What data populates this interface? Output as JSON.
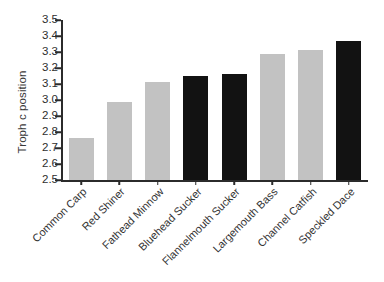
{
  "chart_data": {
    "type": "bar",
    "title": "",
    "xlabel": "",
    "ylabel": "Troph c position",
    "ylim": [
      2.5,
      3.5
    ],
    "ytick_labels": [
      "3.5",
      "3.4",
      "3.3",
      "3.2",
      "3.1",
      "3.0",
      "2.9",
      "2.8",
      "2.7",
      "2.6",
      "2.5"
    ],
    "ytick_values": [
      3.5,
      3.4,
      3.3,
      3.2,
      3.1,
      3.0,
      2.9,
      2.8,
      2.7,
      2.6,
      2.5
    ],
    "grid": false,
    "legend": "none",
    "categories": [
      "Common Carp",
      "Red Shiner",
      "Fathead Minnow",
      "Bluehead Sucker",
      "Flannelmouth Sucker",
      "Largemouth Bass",
      "Channel Catfish",
      "Speckled Dace"
    ],
    "values": [
      2.76,
      2.99,
      3.11,
      3.15,
      3.16,
      3.29,
      3.31,
      3.37
    ],
    "bar_colors": [
      "#c2c2c2",
      "#c2c2c2",
      "#c2c2c2",
      "#121212",
      "#121212",
      "#c2c2c2",
      "#c2c2c2",
      "#121212"
    ],
    "colors": {
      "light_bar": "#c2c2c2",
      "dark_bar": "#121212",
      "axis": "#2b2b2b",
      "text": "#333333",
      "background": "#ffffff"
    }
  }
}
